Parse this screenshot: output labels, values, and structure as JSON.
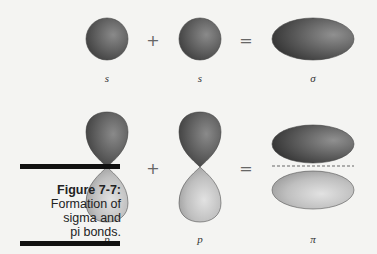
{
  "figure": {
    "number": "Figure 7-7:",
    "caption_lines": [
      "Formation of",
      "sigma and",
      "pi bonds."
    ]
  },
  "rows": [
    {
      "name": "sigma",
      "operand1": "s",
      "operator1": "+",
      "operand2": "s",
      "operator2": "=",
      "result": "σ"
    },
    {
      "name": "pi",
      "operand1": "p",
      "operator1": "+",
      "operand2": "p",
      "operator2": "=",
      "result": "π"
    }
  ],
  "colors": {
    "dark_lobe": "#555555",
    "light_lobe": "#bdbdbd",
    "background": "#f4f4f2"
  }
}
